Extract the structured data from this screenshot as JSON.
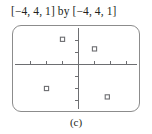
{
  "figure": {
    "range_title": "[−4, 4, 1] by [−4, 4, 1]",
    "caption": "(c)",
    "axis_color": "#6d6e71",
    "frame_color": "#8c8c8c",
    "marker_color": "#6d6e71",
    "background_color": "#ffffff"
  },
  "chart_data": {
    "type": "scatter",
    "title": "[−4, 4, 1] by [−4, 4, 1]",
    "subtitle": "(c)",
    "xlabel": "",
    "ylabel": "",
    "xlim": [
      -4,
      4
    ],
    "ylim": [
      -4,
      4
    ],
    "xtick_step": 1,
    "ytick_step": 1,
    "grid": false,
    "legend": false,
    "axes_shown": true,
    "xticks": [
      -4,
      -3,
      -2,
      -1,
      1,
      2,
      3,
      4
    ],
    "yticks": [
      -3,
      -2,
      -1,
      1,
      2,
      3
    ],
    "series": [
      {
        "name": "points",
        "marker": "open-square",
        "points": [
          {
            "x": -1,
            "y": 2.1
          },
          {
            "x": 1,
            "y": 1.3
          },
          {
            "x": -2,
            "y": -2
          },
          {
            "x": 1.8,
            "y": -2.7
          }
        ]
      }
    ]
  }
}
